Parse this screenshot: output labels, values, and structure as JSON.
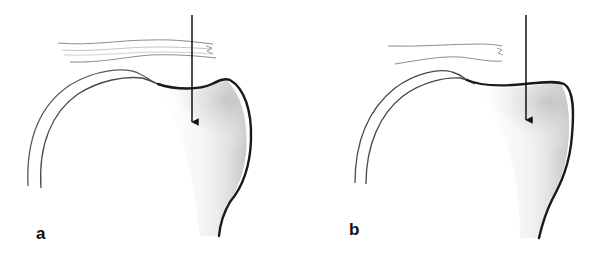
{
  "figure": {
    "panels": [
      {
        "id": "a",
        "label": "a"
      },
      {
        "id": "b",
        "label": "b"
      }
    ],
    "colors": {
      "bone_outline": "#1a1a1a",
      "soft_tissue_line": "#8a8a8a",
      "arrow": "#111111",
      "shading": "#bdbdbd",
      "background": "#ffffff"
    }
  }
}
